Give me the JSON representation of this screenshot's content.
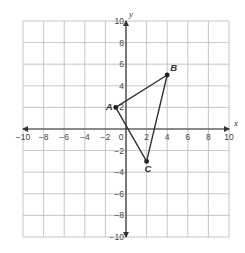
{
  "chart_data": {
    "type": "scatter",
    "title": "",
    "xlabel": "x",
    "ylabel": "y",
    "xlim": [
      -10,
      10
    ],
    "ylim": [
      -10,
      10
    ],
    "grid": true,
    "grid_step": 2,
    "x_ticks": [
      -10,
      -8,
      -6,
      -4,
      -2,
      0,
      2,
      4,
      6,
      8,
      10
    ],
    "y_ticks": [
      -10,
      -8,
      -6,
      -4,
      -2,
      2,
      4,
      6,
      8,
      10
    ],
    "x_tick_labels": [
      "−10",
      "−8",
      "−6",
      "−4",
      "−2",
      "0",
      "2",
      "4",
      "6",
      "8",
      "10"
    ],
    "y_tick_labels": [
      "−10",
      "−8",
      "−6",
      "−4",
      "−2",
      "2",
      "4",
      "6",
      "8",
      "10"
    ],
    "points": [
      {
        "label": "A",
        "x": -1,
        "y": 2
      },
      {
        "label": "B",
        "x": 4,
        "y": 5
      },
      {
        "label": "C",
        "x": 2,
        "y": -3
      }
    ],
    "polygon": [
      "A",
      "B",
      "C"
    ]
  },
  "colors": {
    "grid": "#b8b8b8",
    "axis": "#333333",
    "shape": "#333333"
  },
  "layout": {
    "origin_px": [
      126,
      129
    ],
    "unit_px_x": 10.3,
    "unit_px_y": 10.8
  }
}
